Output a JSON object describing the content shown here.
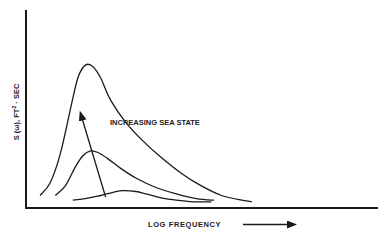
{
  "chart_data": {
    "type": "line",
    "title": "",
    "xlabel": "LOG FREQUENCY",
    "ylabel": "S (ω), FT² · SEC",
    "ylabel_parts": {
      "main": "S (ω), FT",
      "sup": "2",
      "tail": " · SEC"
    },
    "annotation": "INCREASING SEA STATE",
    "x_ticks": [],
    "y_ticks": [],
    "grid": false,
    "xlim": [
      0,
      100
    ],
    "ylim": [
      0,
      100
    ],
    "series": [
      {
        "name": "high sea state",
        "x": [
          4,
          8,
          12,
          16,
          19,
          22,
          25,
          28,
          32,
          38,
          45,
          52,
          60,
          68,
          76,
          84,
          88
        ],
        "y": [
          6,
          14,
          32,
          60,
          80,
          88,
          87,
          80,
          66,
          52,
          40,
          30,
          20,
          12,
          6,
          3,
          2
        ]
      },
      {
        "name": "medium sea state",
        "x": [
          10,
          14,
          18,
          21,
          24,
          27,
          31,
          36,
          42,
          50,
          58,
          66,
          73
        ],
        "y": [
          6,
          12,
          24,
          31,
          34,
          33,
          29,
          23,
          17,
          11,
          7,
          4,
          3
        ]
      },
      {
        "name": "low sea state",
        "x": [
          17,
          22,
          28,
          33,
          37,
          42,
          46,
          52,
          58,
          65,
          72
        ],
        "y": [
          3,
          4,
          6,
          8,
          9,
          8.5,
          7,
          4.5,
          3,
          2,
          2
        ]
      }
    ],
    "arrows": [
      {
        "name": "increasing-sea-state-arrow",
        "from": [
          30,
          5
        ],
        "to": [
          20,
          58
        ]
      }
    ]
  }
}
